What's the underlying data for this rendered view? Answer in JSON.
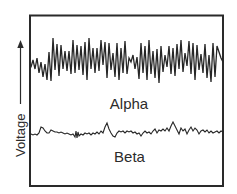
{
  "diagram": {
    "title": "",
    "axis": {
      "y_label": "Voltage",
      "direction": "up-arrow"
    },
    "waves": [
      {
        "name": "Alpha",
        "label": "Alpha",
        "description": "high-amplitude, regular oscillation"
      },
      {
        "name": "Beta",
        "label": "Beta",
        "description": "low-amplitude, irregular fast activity"
      }
    ],
    "colors": {
      "line": "#262626",
      "frame": "#2a2a2a",
      "background": "#ffffff"
    }
  }
}
